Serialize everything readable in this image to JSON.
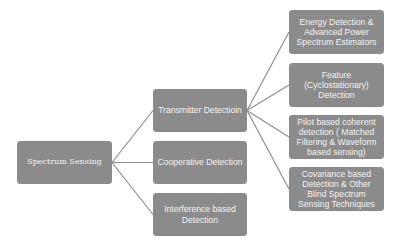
{
  "diagram": {
    "type": "tree",
    "colors": {
      "node_fill": "#8b8b8b",
      "node_text": "#f4f4f4",
      "connector": "#8f8f8f",
      "background": "#ffffff"
    },
    "root": {
      "label": "Spectrum Sensing"
    },
    "level2": [
      {
        "id": "transmitter",
        "label": "Transmitter Detectioin"
      },
      {
        "id": "cooperative",
        "label": "Cooperative Detection"
      },
      {
        "id": "interference",
        "label": "Interference based Detection"
      }
    ],
    "level3": [
      {
        "id": "energy",
        "parent": "transmitter",
        "label": "Energy Detection & Advanced Power Spectrum Estimators"
      },
      {
        "id": "feature",
        "parent": "transmitter",
        "label": "Feature (Cyclostationary) Detection"
      },
      {
        "id": "pilot",
        "parent": "transmitter",
        "label": "Pilot based coherent detection ( Matched Filtering & Waveform based sensing)"
      },
      {
        "id": "covariance",
        "parent": "transmitter",
        "label": "Covariance based Detection & Other Blind Spectrum Sensing Techniques"
      }
    ],
    "edges": [
      [
        "Spectrum Sensing",
        "Transmitter Detectioin"
      ],
      [
        "Spectrum Sensing",
        "Cooperative Detection"
      ],
      [
        "Spectrum Sensing",
        "Interference based Detection"
      ],
      [
        "Transmitter Detectioin",
        "Energy Detection & Advanced Power Spectrum Estimators"
      ],
      [
        "Transmitter Detectioin",
        "Feature (Cyclostationary) Detection"
      ],
      [
        "Transmitter Detectioin",
        "Pilot based coherent detection ( Matched Filtering & Waveform based sensing)"
      ],
      [
        "Transmitter Detectioin",
        "Covariance based Detection & Other Blind Spectrum Sensing Techniques"
      ]
    ]
  }
}
